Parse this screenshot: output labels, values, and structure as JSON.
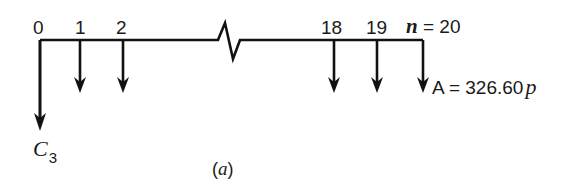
{
  "diagram": {
    "type": "cash-flow-diagram",
    "caption": "(a)",
    "caption_letter": "a",
    "timeline": {
      "period_labels": [
        "0",
        "1",
        "2",
        "18",
        "19"
      ],
      "last_period_variable": "n",
      "last_period_equals": "=",
      "last_period_value": "20",
      "has_break": true
    },
    "initial_cash_flow": {
      "period": "0",
      "direction": "down",
      "label_symbol": "C",
      "label_subscript": "3"
    },
    "annuity": {
      "periods": [
        "1",
        "2",
        "18",
        "19",
        "20"
      ],
      "direction": "down",
      "label_prefix": "A",
      "label_equals": "=",
      "label_value": "326.60",
      "label_unit": "p"
    },
    "colors": {
      "line": "#111111",
      "background": "#ffffff"
    }
  }
}
